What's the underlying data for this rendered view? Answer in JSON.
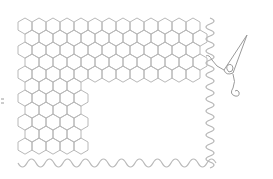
{
  "illustration": {
    "title": "Hexagon quilt with wavy border and needle",
    "background": "#ffffff",
    "stroke_color": "#b8b8b8",
    "needle_color": "#9a9a9a",
    "hex_grid": {
      "hex_width": 14,
      "row_spacing": 12,
      "upper_block": {
        "x0": 18,
        "x1": 210,
        "y0": 18,
        "y1": 76
      },
      "lower_block": {
        "x0": 18,
        "x1": 90,
        "y0": 76,
        "y1": 158
      }
    },
    "wavy_border": {
      "right_edge": {
        "x": 210,
        "y0": 18,
        "y1": 164,
        "amplitude": 4,
        "period": 12
      },
      "bottom_edge": {
        "y": 163,
        "x0": 18,
        "x1": 212,
        "amplitude": 4,
        "period": 18
      }
    },
    "needle": {
      "tip": [
        247,
        35
      ],
      "eye": [
        228,
        72
      ]
    },
    "left_tick": {
      "x": 2,
      "y": 101
    }
  }
}
